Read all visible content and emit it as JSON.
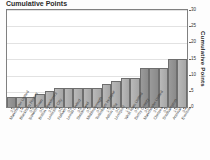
{
  "title": "Cumulative Points",
  "axis": {
    "y_label": "Cumulative Points",
    "y_ticks": [
      "0",
      "5",
      "10",
      "15",
      "20",
      "25",
      "30"
    ]
  },
  "chart_data": {
    "type": "bar",
    "title": "Cumulative Points",
    "xlabel": "",
    "ylabel": "Cumulative Points",
    "ylim": [
      0,
      30
    ],
    "grid": true,
    "legend": "none",
    "y_axis_position": "right",
    "categories": [
      "Manchester United",
      "Blackburn Rovers",
      "Ipswich Town",
      "Bolton Wanderers",
      "Leicester City",
      "Fulham",
      "Leeds United",
      "Sunderland",
      "Middlesbrough",
      "Tottenham Hotspur",
      "Aston Villa",
      "Liverpool",
      "West Ham United",
      "Derby County",
      "Manchester United",
      "Chelsea",
      "Southampton",
      "Arsenal",
      "Everton"
    ],
    "scores": [
      "2-1",
      "1-4",
      "0-1",
      "0-0",
      "2-2",
      "0-0",
      "0-3",
      "3-3",
      "0-1",
      "0-1",
      "1-1",
      "0-0",
      "1-1",
      "0-1",
      "3-0",
      "2-0",
      "0-3",
      "1-0",
      "3-4"
    ],
    "values": [
      3,
      3,
      3,
      4,
      5,
      6,
      6,
      6,
      6,
      6,
      7,
      8,
      9,
      9,
      12,
      12,
      12,
      15,
      15
    ]
  }
}
